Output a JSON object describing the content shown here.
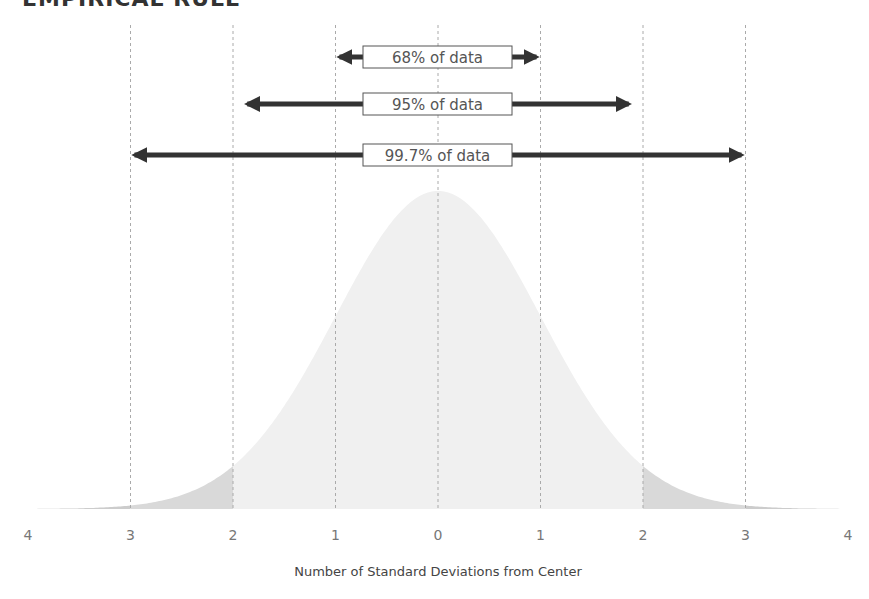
{
  "title": "EMPIRICAL RULE",
  "chart_data": {
    "type": "area",
    "title": "EMPIRICAL RULE",
    "xlabel": "Number of Standard Deviations from Center",
    "ylabel": "",
    "x_ticks": [
      -4,
      -3,
      -2,
      -1,
      0,
      1,
      2,
      3,
      4
    ],
    "x_tick_labels": [
      "4",
      "3",
      "2",
      "1",
      "0",
      "1",
      "2",
      "3",
      "4"
    ],
    "xlim": [
      -4,
      4
    ],
    "distribution": "standard normal",
    "gridlines": {
      "vertical_dashed_at": [
        -3,
        -2,
        -1,
        0,
        1,
        2,
        3
      ]
    },
    "shaded_regions": [
      {
        "range": [
          -2,
          2
        ],
        "color": "#f0f0f0"
      },
      {
        "range": [
          -3,
          -2
        ],
        "color": "#d9d9d9"
      },
      {
        "range": [
          2,
          3
        ],
        "color": "#d9d9d9"
      },
      {
        "range": [
          -4,
          -3
        ],
        "color": "#cccccc"
      },
      {
        "range": [
          3,
          4
        ],
        "color": "#cccccc"
      }
    ],
    "annotations": [
      {
        "label": "68% of data",
        "range": [
          -1,
          1
        ]
      },
      {
        "label": "95% of data",
        "range": [
          -1.9,
          1.9
        ]
      },
      {
        "label": "99.7% of data",
        "range": [
          -3,
          3
        ]
      }
    ],
    "legend": null,
    "grid": false
  },
  "colors": {
    "arrow": "#333333",
    "gridline": "#aaaaaa",
    "center_fill": "#f0f0f0",
    "tail_fill": "#d9d9d9"
  }
}
